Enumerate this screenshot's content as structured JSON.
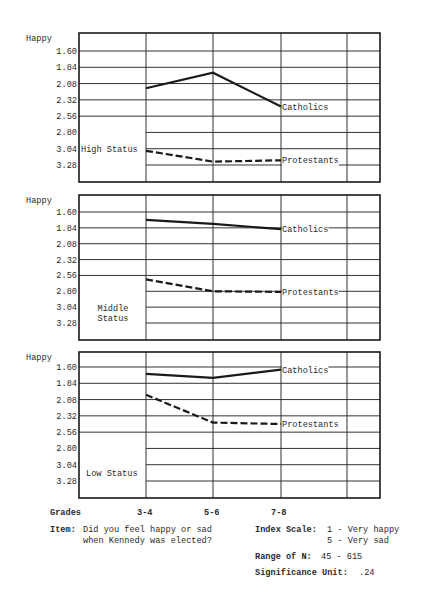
{
  "chart_data": {
    "type": "line",
    "title": "",
    "xlabel": "Grades",
    "ylabel": "Happy",
    "categories": [
      "3-4",
      "5-6",
      "7-8"
    ],
    "y_ticks": [
      "1.60",
      "1.84",
      "2.08",
      "2.32",
      "2.56",
      "2.80",
      "3.04",
      "3.28"
    ],
    "ylim": [
      1.36,
      3.52
    ],
    "y_inverted": true,
    "grid": true,
    "panels": [
      {
        "name": "High Status",
        "label_lines": [
          "High Status"
        ],
        "y_axis_label": "Happy",
        "series": [
          {
            "name": "Catholics",
            "style": "solid",
            "values": [
              2.15,
              1.92,
              2.42
            ]
          },
          {
            "name": "Protestants",
            "style": "dashed",
            "values": [
              3.07,
              3.23,
              3.21
            ]
          }
        ]
      },
      {
        "name": "Middle Status",
        "label_lines": [
          "Middle",
          "Status"
        ],
        "y_axis_label": "Happy",
        "series": [
          {
            "name": "Catholics",
            "style": "solid",
            "values": [
              1.72,
              1.78,
              1.86
            ]
          },
          {
            "name": "Protestants",
            "style": "dashed",
            "values": [
              2.62,
              2.8,
              2.81
            ]
          }
        ]
      },
      {
        "name": "Low Status",
        "label_lines": [
          "Low Status"
        ],
        "y_axis_label": "Happy",
        "series": [
          {
            "name": "Catholics",
            "style": "solid",
            "values": [
              1.7,
              1.76,
              1.64
            ]
          },
          {
            "name": "Protestants",
            "style": "dashed",
            "values": [
              2.01,
              2.42,
              2.44
            ]
          }
        ]
      }
    ]
  },
  "footer": {
    "grades_label": "Grades",
    "grade_ticks": [
      "3-4",
      "5-6",
      "7-8"
    ],
    "item_label": "Item:",
    "item_text_line1": "Did you feel happy or sad",
    "item_text_line2": "when Kennedy was elected?",
    "index_scale_label": "Index Scale:",
    "index_scale_line1": "1 - Very happy",
    "index_scale_line2": "5 - Very sad",
    "range_label": "Range of N:",
    "range_value": "45 - 615",
    "significance_label": "Significance Unit:",
    "significance_value": ".24"
  },
  "colors": {
    "ink": "#1a1a1a",
    "grid": "#333333",
    "background": "#ffffff"
  }
}
